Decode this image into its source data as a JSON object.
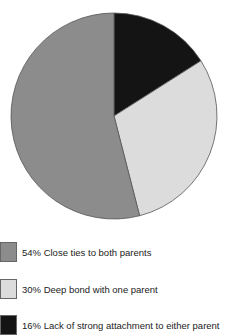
{
  "chart_data": {
    "type": "pie",
    "title": "",
    "start": "12 o'clock",
    "direction": "clockwise",
    "slices": [
      {
        "label": "Lack of strong attachment to either parent",
        "value": 16,
        "color": "#141414"
      },
      {
        "label": "Deep bond with one parent",
        "value": 30,
        "color": "#dcdcdc"
      },
      {
        "label": "Close ties to both parents",
        "value": 54,
        "color": "#8c8c8c"
      }
    ],
    "legend": {
      "placement": "bottom",
      "entries": [
        {
          "text": "54% Close ties to both parents",
          "color": "#8c8c8c"
        },
        {
          "text": "30% Deep bond with one parent",
          "color": "#dcdcdc"
        },
        {
          "text": "16% Lack of strong attachment to either parent",
          "color": "#141414"
        }
      ]
    }
  }
}
